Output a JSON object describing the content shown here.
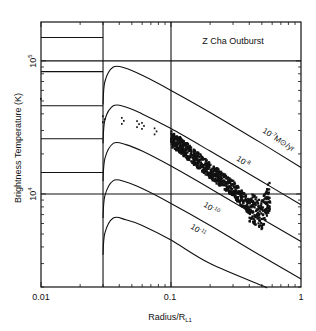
{
  "chart_data": {
    "type": "line",
    "title": "Z Cha Outburst",
    "xlabel": "Radius/R_L1",
    "xlabel_main": "Radius/R",
    "xlabel_sub": "L1",
    "ylabel": "Brightness Temperature (K)",
    "xscale": "log",
    "yscale": "log",
    "xlim": [
      0.01,
      1
    ],
    "ylim": [
      2000,
      196000
    ],
    "xticks": [
      {
        "value": 0.01,
        "label": "0.01"
      },
      {
        "value": 0.1,
        "label": "0.1"
      },
      {
        "value": 1,
        "label": "1"
      }
    ],
    "yticks": [
      {
        "value": 10000,
        "base": "10",
        "exp": "4"
      },
      {
        "value": 100000,
        "base": "10",
        "exp": "5"
      }
    ],
    "grid": false,
    "reference_lines": {
      "vertical_x": [
        0.03,
        0.1
      ],
      "horizontal_y": [
        10000,
        100000
      ],
      "step_levels_left_of_0.03": [
        150000,
        83000,
        46000,
        26000,
        14500
      ]
    },
    "series": [
      {
        "name": "10^-7 Mo/yr",
        "label_base": "10",
        "label_exp": "-7",
        "label_unit": "M⊙/yr",
        "x": [
          0.03,
          0.031,
          0.036,
          0.045,
          0.06,
          0.1,
          0.2,
          0.5,
          1.0
        ],
        "y": [
          47000,
          70000,
          90000,
          88000,
          78000,
          60000,
          41000,
          24000,
          15800
        ]
      },
      {
        "name": "10^-8",
        "label_base": "10",
        "label_exp": "-8",
        "x": [
          0.03,
          0.031,
          0.036,
          0.045,
          0.06,
          0.1,
          0.2,
          0.5,
          1.0
        ],
        "y": [
          24000,
          36000,
          46000,
          45000,
          40000,
          31000,
          21000,
          12400,
          8300
        ]
      },
      {
        "name": "10^-9",
        "label_base": "",
        "label_exp": "",
        "x": [
          0.03,
          0.031,
          0.036,
          0.045,
          0.06,
          0.1,
          0.2,
          0.5,
          1.0
        ],
        "y": [
          12500,
          18500,
          24000,
          23500,
          21000,
          16200,
          11000,
          6500,
          4400
        ]
      },
      {
        "name": "10^-10",
        "label_base": "10",
        "label_exp": "-10",
        "x": [
          0.03,
          0.031,
          0.036,
          0.045,
          0.06,
          0.1,
          0.2,
          0.5,
          1.0
        ],
        "y": [
          6600,
          9700,
          12600,
          12300,
          11000,
          8500,
          5800,
          3400,
          2300
        ]
      },
      {
        "name": "10^-11",
        "label_base": "10",
        "label_exp": "-11",
        "x": [
          0.03,
          0.031,
          0.036,
          0.045,
          0.06,
          0.1,
          0.2,
          0.5,
          0.53
        ],
        "y": [
          3500,
          5100,
          6600,
          6400,
          5800,
          4500,
          3000,
          2050,
          2000
        ]
      }
    ],
    "observations": {
      "name": "Z Cha outburst eclipse map",
      "points": [
        {
          "x": 0.01,
          "y": 50000
        },
        {
          "x": 0.03,
          "y": 37000
        },
        {
          "x": 0.042,
          "y": 36000
        },
        {
          "x": 0.055,
          "y": 34000
        },
        {
          "x": 0.06,
          "y": 33000
        },
        {
          "x": 0.075,
          "y": 30000
        },
        {
          "x": 0.1,
          "y": 26000
        },
        {
          "x": 0.12,
          "y": 23000
        },
        {
          "x": 0.15,
          "y": 19000
        },
        {
          "x": 0.2,
          "y": 15000
        },
        {
          "x": 0.3,
          "y": 11000
        },
        {
          "x": 0.4,
          "y": 8000
        },
        {
          "x": 0.5,
          "y": 7000
        },
        {
          "x": 0.55,
          "y": 9000
        },
        {
          "x": 0.58,
          "y": 10000
        }
      ]
    }
  }
}
